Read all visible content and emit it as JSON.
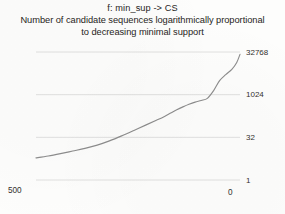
{
  "chart_data": {
    "type": "line",
    "title": "f: min_sup -> CS",
    "subtitle_line1": "Number of candidate sequences logarithmically proportional",
    "subtitle_line2": "to decreasing minimal support",
    "xlabel": "",
    "ylabel": "",
    "x_ticks": [
      "500",
      "0"
    ],
    "y_ticks": [
      "32768",
      "1024",
      "32",
      "1"
    ],
    "y_tick_values": [
      32768,
      1024,
      32,
      1
    ],
    "y_scale": "log",
    "y_log_base": 32,
    "ylim": [
      1,
      32768
    ],
    "xlim": [
      500,
      0
    ],
    "x_axis_direction": "decreasing",
    "grid": true,
    "grid_axis": "y",
    "legend": false,
    "y_axis_position": "right",
    "series": [
      {
        "name": "candidate sequences",
        "color": "#8d8d8d",
        "x": [
          500,
          470,
          440,
          410,
          380,
          350,
          320,
          290,
          260,
          230,
          205,
          185,
          170,
          155,
          140,
          125,
          110,
          95,
          80,
          65,
          50,
          35,
          20,
          8,
          0
        ],
        "values": [
          6,
          7,
          8.5,
          10.5,
          13,
          17,
          24,
          36,
          56,
          88,
          128,
          175,
          230,
          300,
          380,
          470,
          560,
          640,
          760,
          1400,
          3200,
          5200,
          8000,
          14000,
          27000
        ]
      }
    ],
    "colors": {
      "line": "#8d8d8d",
      "grid": "#d8d8d8",
      "text": "#272422",
      "background": "#fdfdfc"
    }
  },
  "geometry": {
    "plot_left": 36,
    "plot_right": 240,
    "plot_top": 52,
    "plot_bottom": 180
  }
}
